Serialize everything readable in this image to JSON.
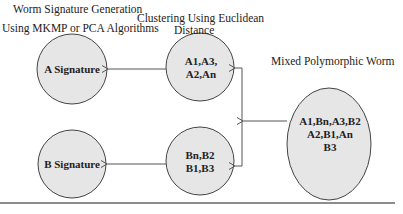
{
  "titles": {
    "signature_generation_line1": "Worm Signature Generation",
    "signature_generation_line2": "Using MKMP or PCA Algorithms",
    "clustering_line1": "Clustering Using Euclidean",
    "clustering_line2": "Distance",
    "mixed_worm": "Mixed Polymorphic Worm"
  },
  "nodes": {
    "a_signature": {
      "label": "A Signature"
    },
    "b_signature": {
      "label": "B Signature"
    },
    "a_cluster": {
      "line1": "A1,A3,",
      "line2": "A2,An"
    },
    "b_cluster": {
      "line1": "Bn,B2",
      "line2": "B1,B3"
    },
    "mixed_worm": {
      "line1": "A1,Bn,A3,B2",
      "line2": "A2,B1,An",
      "line3": "B3"
    }
  },
  "colors": {
    "node_fill": "#e6e6e6",
    "node_stroke": "#444444",
    "edge": "#555555"
  }
}
